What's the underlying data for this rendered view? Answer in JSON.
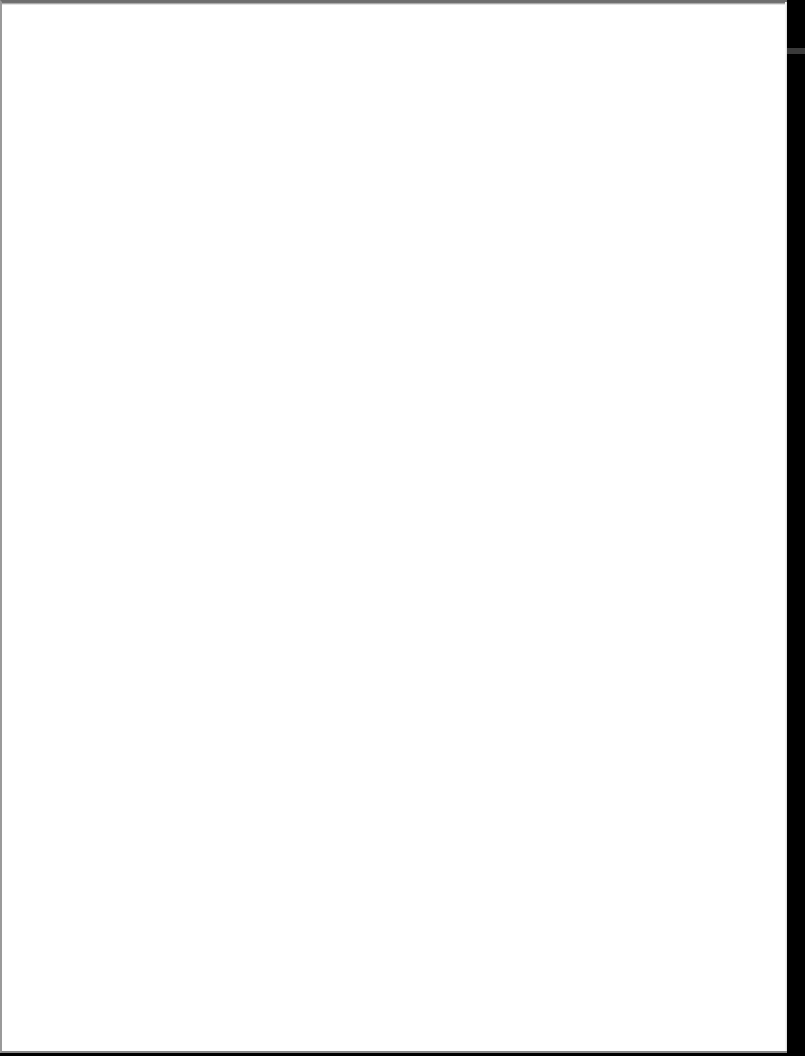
{
  "document": {
    "type": "scanned-page",
    "content_text": "",
    "is_blank": true,
    "colors": {
      "paper": "#ffffff",
      "scanner_background": "#000000",
      "page_border": "#8a8a8a"
    }
  }
}
